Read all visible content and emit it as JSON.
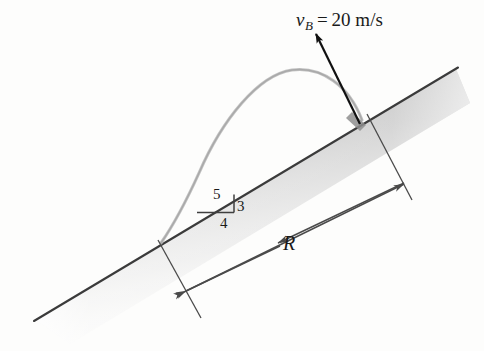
{
  "figure": {
    "background_color": "#fdfdfc",
    "labels": {
      "velocity_symbol": "v",
      "velocity_subscript": "B",
      "equals": "=",
      "velocity_value": "20 m/s",
      "range_label": "R",
      "slope_hypotenuse": "5",
      "slope_vertical": "3",
      "slope_horizontal": "4"
    },
    "colors": {
      "incline_edge": "#3b3b3b",
      "incline_fill_dark": "#b9b9b9",
      "incline_fill_light": "#e8e8e8",
      "trajectory": "#b3b3b3",
      "dimension_line": "#4a4a4a",
      "arrow": "#111111",
      "text": "#1a1a1a"
    },
    "geometry": {
      "incline_top_right": [
        456,
        69
      ],
      "incline_bottom_left": [
        36,
        320
      ],
      "launch_point": [
        364,
        119
      ],
      "landing_point": [
        161,
        243
      ],
      "velocity_arrow_tip": [
        313,
        31
      ],
      "trajectory_apex": [
        292,
        72
      ],
      "range_arrow_left": [
        189,
        292
      ],
      "range_arrow_right": [
        401,
        186
      ],
      "slope_triangle_right_vertex": [
        234,
        212
      ],
      "slope_triangle_left_vertex": [
        197,
        212
      ],
      "slope_triangle_top_vertex": [
        234,
        195
      ]
    }
  }
}
